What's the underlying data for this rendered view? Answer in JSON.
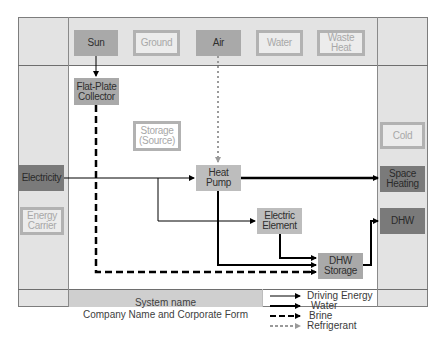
{
  "sources": {
    "sun": "Sun",
    "ground": "Ground",
    "air": "Air",
    "water": "Water",
    "waste_heat": "Waste Heat"
  },
  "components": {
    "flat_plate_collector": "Flat-Plate Collector",
    "storage_source": "Storage (Source)",
    "heat_pump": "Heat Pump",
    "electric_element": "Electric Element",
    "dhw_storage": "DHW Storage"
  },
  "energy_carriers": {
    "electricity": "Electricity",
    "energy_carrier": "Energy Carrier"
  },
  "outputs": {
    "cold": "Cold",
    "space_heating": "Space Heating",
    "dhw": "DHW"
  },
  "footer": {
    "system_name": "System name",
    "company": "Company Name and Corporate Form"
  },
  "legend": [
    {
      "label": "Driving Energy",
      "style": "thin-solid"
    },
    {
      "label": "Water",
      "style": "thick-solid"
    },
    {
      "label": "Brine",
      "style": "thick-dashed"
    },
    {
      "label": "Refrigerant",
      "style": "grey-dotted"
    }
  ],
  "colors": {
    "active_box": "#a9a9a9",
    "output_box": "#7a7a7a",
    "inactive_border": "#b2b2b2",
    "grid_fill": "#e3e3e3",
    "line": "#000000",
    "refrigerant": "#9a9a9a"
  }
}
